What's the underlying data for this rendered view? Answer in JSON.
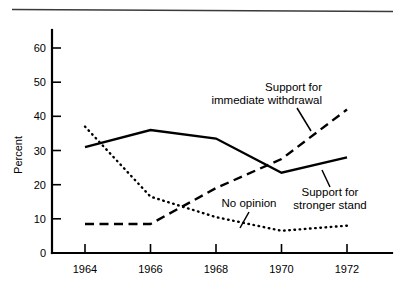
{
  "chart_data": {
    "type": "line",
    "title": "",
    "xlabel": "",
    "ylabel": "Percent",
    "x": [
      1964,
      1966,
      1968,
      1970,
      1972
    ],
    "categories": [
      "1964",
      "1966",
      "1968",
      "1970",
      "1972"
    ],
    "xlim": [
      1963,
      1973
    ],
    "ylim": [
      0,
      65
    ],
    "yticks": [
      0,
      10,
      20,
      30,
      40,
      50,
      60
    ],
    "ytick_labels": [
      "0",
      "10",
      "20",
      "30",
      "40",
      "50",
      "60"
    ],
    "xticks": [
      1964,
      1966,
      1968,
      1970,
      1972
    ],
    "xtick_labels": [
      "1964",
      "1966",
      "1968",
      "1970",
      "1972"
    ],
    "grid": false,
    "legend_position": "annotations-inline",
    "series": [
      {
        "name": "Support for stronger stand",
        "style": "solid",
        "values": [
          31,
          36,
          33.5,
          23.5,
          28
        ]
      },
      {
        "name": "No opinion",
        "style": "dotted",
        "values": [
          37,
          16.5,
          10.5,
          6.5,
          8
        ]
      },
      {
        "name": "Support for immediate withdrawal",
        "style": "dashed",
        "values": [
          8.5,
          8.5,
          19,
          27.5,
          42
        ]
      }
    ],
    "annotations": [
      {
        "id": "annot-withdrawal",
        "line1": "Support for",
        "line2": "immediate withdrawal",
        "target_series": "Support for immediate withdrawal"
      },
      {
        "id": "annot-no-opinion",
        "line1": "No opinion",
        "line2": "",
        "target_series": "No opinion"
      },
      {
        "id": "annot-stronger",
        "line1": "Support for",
        "line2": "stronger stand",
        "target_series": "Support for stronger stand"
      }
    ]
  },
  "axis": {
    "y_title": "Percent"
  }
}
